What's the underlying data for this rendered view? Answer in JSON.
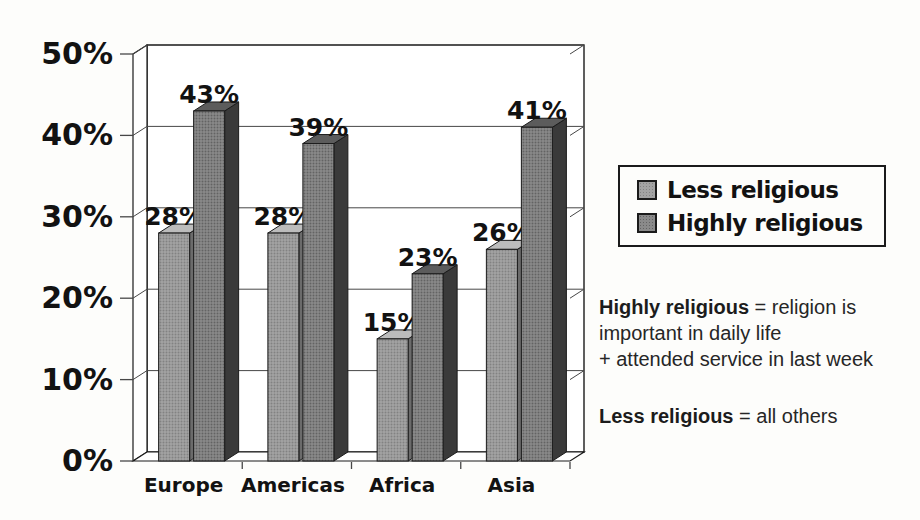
{
  "chart_data": {
    "type": "bar",
    "variant": "3d-clustered-column",
    "title": "",
    "categories": [
      "Europe",
      "Americas",
      "Africa",
      "Asia"
    ],
    "series": [
      {
        "name": "Less religious",
        "values": [
          28,
          28,
          15,
          26
        ],
        "front": "#a3a3a3",
        "dot": "#828282",
        "top": "#bcbcbc",
        "side": "#6b6b6b"
      },
      {
        "name": "Highly religious",
        "values": [
          43,
          39,
          23,
          41
        ],
        "front": "#8a8a8a",
        "dot": "#636363",
        "top": "#5c5c5c",
        "side": "#3a3a3a"
      }
    ],
    "ylim": [
      0,
      50
    ],
    "y_ticks": [
      "0%",
      "10%",
      "20%",
      "30%",
      "40%",
      "50%"
    ],
    "value_label_suffix": "%",
    "grid": true,
    "legend_position": "right",
    "colors": {
      "outline": "#1b1b1b",
      "gridline": "#474747",
      "wall_fill": "#ffffff",
      "text": "#121212"
    }
  },
  "legend": {
    "items": [
      {
        "label": "Less religious"
      },
      {
        "label": "Highly religious"
      }
    ]
  },
  "notes": [
    {
      "lead": "Highly religious",
      "lines": [
        " = religion is",
        "important in daily life",
        "+ attended service in last week"
      ]
    },
    {
      "lead": "Less religious",
      "lines": [
        " = all others"
      ]
    }
  ]
}
